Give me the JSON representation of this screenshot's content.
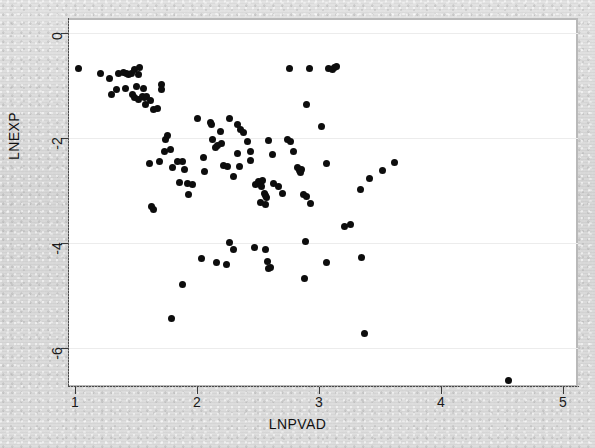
{
  "figure": {
    "background_color": "#dcdcdc",
    "plot_background_color": "#ffffff",
    "marker_color": "#0d0d0d",
    "grid_color": "#ececec"
  },
  "chart_data": {
    "type": "scatter",
    "title": "",
    "subtitle": "",
    "xlabel": "LNPVAD",
    "ylabel": "LNEXP",
    "xlim": [
      1,
      5
    ],
    "ylim": [
      -7,
      0.3
    ],
    "xticks": [
      1,
      2,
      3,
      4,
      5
    ],
    "yticks": [
      0,
      -2,
      -4,
      -6
    ],
    "xtick_labels": [
      "1",
      "2",
      "3",
      "4",
      "5"
    ],
    "ytick_labels": [
      "0",
      "-2",
      "-4",
      "-6"
    ],
    "grid": true,
    "grid_axis": "y",
    "legend": null,
    "legend_position": "none",
    "marker": "circle",
    "marker_size": 7,
    "n_points": 126,
    "points": [
      [
        1.03,
        -0.67
      ],
      [
        1.21,
        -0.78
      ],
      [
        1.28,
        -0.87
      ],
      [
        1.3,
        -1.18
      ],
      [
        1.36,
        -0.78
      ],
      [
        1.4,
        -0.76
      ],
      [
        1.42,
        -0.77
      ],
      [
        1.41,
        -1.05
      ],
      [
        1.44,
        -0.79
      ],
      [
        1.46,
        -0.78
      ],
      [
        1.47,
        -1.17
      ],
      [
        1.34,
        -1.07
      ],
      [
        1.49,
        -0.7
      ],
      [
        1.53,
        -0.66
      ],
      [
        1.52,
        -0.79
      ],
      [
        1.5,
        -1.02
      ],
      [
        1.49,
        -1.22
      ],
      [
        1.52,
        -1.26
      ],
      [
        1.56,
        -1.05
      ],
      [
        1.55,
        -1.2
      ],
      [
        1.57,
        -1.23
      ],
      [
        1.59,
        -1.21
      ],
      [
        1.58,
        -1.37
      ],
      [
        1.62,
        -1.28
      ],
      [
        1.64,
        -1.45
      ],
      [
        1.71,
        -0.99
      ],
      [
        1.71,
        -1.08
      ],
      [
        1.68,
        -1.43
      ],
      [
        1.61,
        -2.48
      ],
      [
        1.63,
        -3.3
      ],
      [
        1.64,
        -3.37
      ],
      [
        1.69,
        -2.45
      ],
      [
        1.74,
        -2.02
      ],
      [
        1.76,
        -1.95
      ],
      [
        1.73,
        -2.26
      ],
      [
        1.78,
        -2.22
      ],
      [
        1.8,
        -2.57
      ],
      [
        1.84,
        -2.45
      ],
      [
        1.86,
        -2.84
      ],
      [
        1.88,
        -2.45
      ],
      [
        1.9,
        -2.6
      ],
      [
        1.92,
        -2.86
      ],
      [
        1.93,
        -3.07
      ],
      [
        1.96,
        -2.89
      ],
      [
        2.0,
        -1.63
      ],
      [
        2.05,
        -2.38
      ],
      [
        2.06,
        -2.64
      ],
      [
        2.11,
        -1.7
      ],
      [
        2.12,
        -1.74
      ],
      [
        2.13,
        -2.03
      ],
      [
        2.15,
        -2.19
      ],
      [
        2.17,
        -2.15
      ],
      [
        2.19,
        -1.88
      ],
      [
        2.2,
        -2.1
      ],
      [
        2.22,
        -2.52
      ],
      [
        2.25,
        -2.55
      ],
      [
        2.27,
        -1.62
      ],
      [
        2.3,
        -2.73
      ],
      [
        2.33,
        -1.75
      ],
      [
        2.36,
        -1.83
      ],
      [
        2.33,
        -2.29
      ],
      [
        2.35,
        -2.54
      ],
      [
        2.38,
        -1.9
      ],
      [
        2.41,
        -2.07
      ],
      [
        2.44,
        -2.25
      ],
      [
        2.44,
        -2.42
      ],
      [
        2.48,
        -2.88
      ],
      [
        2.5,
        -2.82
      ],
      [
        2.52,
        -2.86
      ],
      [
        2.54,
        -2.8
      ],
      [
        2.53,
        -2.93
      ],
      [
        2.55,
        -3.06
      ],
      [
        2.56,
        -3.1
      ],
      [
        2.57,
        -3.14
      ],
      [
        2.52,
        -3.22
      ],
      [
        2.56,
        -3.26
      ],
      [
        2.59,
        -2.05
      ],
      [
        2.62,
        -2.32
      ],
      [
        2.63,
        -2.87
      ],
      [
        2.67,
        -2.93
      ],
      [
        2.7,
        -3.05
      ],
      [
        2.74,
        -2.02
      ],
      [
        2.77,
        -2.07
      ],
      [
        2.79,
        -2.26
      ],
      [
        2.76,
        -0.67
      ],
      [
        2.82,
        -2.57
      ],
      [
        2.84,
        -2.62
      ],
      [
        2.86,
        -2.6
      ],
      [
        2.85,
        -2.66
      ],
      [
        2.87,
        -3.07
      ],
      [
        2.9,
        -3.12
      ],
      [
        2.93,
        -3.25
      ],
      [
        2.9,
        -1.36
      ],
      [
        2.92,
        -0.68
      ],
      [
        3.02,
        -1.79
      ],
      [
        3.06,
        -2.48
      ],
      [
        3.08,
        -0.67
      ],
      [
        3.11,
        -0.69
      ],
      [
        3.13,
        -0.66
      ],
      [
        3.14,
        -0.64
      ],
      [
        3.21,
        -3.68
      ],
      [
        3.26,
        -3.65
      ],
      [
        3.34,
        -2.99
      ],
      [
        3.41,
        -2.77
      ],
      [
        3.52,
        -2.62
      ],
      [
        3.62,
        -2.46
      ],
      [
        1.79,
        -5.44
      ],
      [
        1.88,
        -4.79
      ],
      [
        2.04,
        -4.3
      ],
      [
        2.16,
        -4.38
      ],
      [
        2.24,
        -4.41
      ],
      [
        2.27,
        -3.99
      ],
      [
        2.3,
        -4.12
      ],
      [
        2.47,
        -4.09
      ],
      [
        2.56,
        -4.13
      ],
      [
        2.58,
        -4.36
      ],
      [
        2.6,
        -4.46
      ],
      [
        2.59,
        -4.49
      ],
      [
        2.89,
        -3.98
      ],
      [
        2.88,
        -4.68
      ],
      [
        3.06,
        -4.38
      ],
      [
        3.35,
        -4.28
      ],
      [
        3.37,
        -5.73
      ],
      [
        4.55,
        -6.62
      ]
    ]
  },
  "axis_title_rotation": {
    "y": -90
  }
}
